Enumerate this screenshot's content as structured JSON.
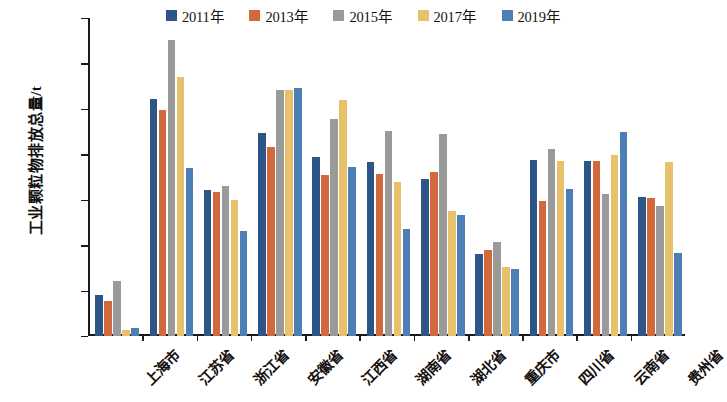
{
  "chart_data": {
    "type": "bar",
    "title": "",
    "xlabel": "",
    "ylabel": "工业颗粒物排放总量/t",
    "ylim": [
      0,
      700000
    ],
    "ytick_values": [
      0,
      100000,
      200000,
      300000,
      400000,
      500000,
      600000,
      700000
    ],
    "ytick_labels": [
      "0",
      "100000",
      "200000",
      "300000",
      "400000",
      "500000",
      "600000",
      "700000"
    ],
    "grid": false,
    "legend_position": "top",
    "categories": [
      "上海市",
      "江苏省",
      "浙江省",
      "安徽省",
      "江西省",
      "湖南省",
      "湖北省",
      "重庆市",
      "四川省",
      "云南省",
      "贵州省"
    ],
    "series": [
      {
        "name": "2011年",
        "color": "#2e5588",
        "values": [
          90000,
          522000,
          322000,
          447000,
          394000,
          383000,
          345000,
          181000,
          387000,
          385000,
          305000
        ]
      },
      {
        "name": "2013年",
        "color": "#d2693c",
        "values": [
          78000,
          497000,
          318000,
          415000,
          355000,
          357000,
          361000,
          190000,
          297000,
          385000,
          303000
        ]
      },
      {
        "name": "2015年",
        "color": "#9a9a9a",
        "values": [
          122000,
          652000,
          330000,
          542000,
          478000,
          452000,
          445000,
          208000,
          412000,
          313000,
          287000
        ]
      },
      {
        "name": "2017年",
        "color": "#e8c26a",
        "values": [
          13000,
          570000,
          300000,
          542000,
          519000,
          340000,
          276000,
          152000,
          385000,
          399000,
          382000
        ]
      },
      {
        "name": "2019年",
        "color": "#4b7fb5",
        "values": [
          17000,
          370000,
          232000,
          546000,
          372000,
          235000,
          267000,
          148000,
          323000,
          448000,
          183000
        ]
      }
    ]
  }
}
